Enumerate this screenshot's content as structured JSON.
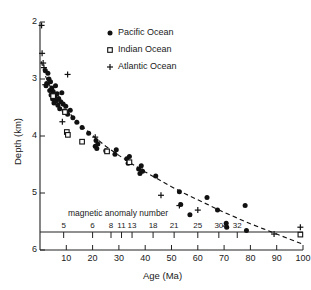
{
  "chart_data": {
    "type": "scatter",
    "title": "",
    "xlabel": "Age (Ma)",
    "ylabel": "Depth (km)",
    "xlim": [
      0,
      100
    ],
    "ylim": [
      6,
      2
    ],
    "y_inverted": true,
    "grid": false,
    "legend_position": "top-center",
    "x_ticks": [
      10,
      20,
      30,
      40,
      50,
      60,
      70,
      80,
      90,
      100
    ],
    "y_ticks": [
      2,
      3,
      4,
      5,
      6
    ],
    "secondary_axis": {
      "title": "magnetic anomaly number",
      "ticks": [
        {
          "label": "5",
          "age": 9
        },
        {
          "label": "6",
          "age": 20
        },
        {
          "label": "8",
          "age": 27
        },
        {
          "label": "11",
          "age": 31
        },
        {
          "label": "13",
          "age": 35
        },
        {
          "label": "18",
          "age": 43
        },
        {
          "label": "21",
          "age": 51
        },
        {
          "label": "25",
          "age": 60
        },
        {
          "label": "30",
          "age": 68
        },
        {
          "label": "32",
          "age": 75
        }
      ]
    },
    "legend": [
      {
        "name": "Pacific Ocean",
        "marker": "filled-circle"
      },
      {
        "name": "Indian Ocean",
        "marker": "open-square"
      },
      {
        "name": "Atlantic Ocean",
        "marker": "plus"
      }
    ],
    "curve": {
      "name": "theoretical subsidence",
      "style": "dashed",
      "model": "depth = 2.45 + 0.345 * sqrt(age)",
      "points": [
        [
          0.5,
          2.69
        ],
        [
          1,
          2.79
        ],
        [
          2,
          2.94
        ],
        [
          3,
          3.05
        ],
        [
          4,
          3.14
        ],
        [
          6,
          3.3
        ],
        [
          8,
          3.43
        ],
        [
          10,
          3.54
        ],
        [
          13,
          3.69
        ],
        [
          16,
          3.83
        ],
        [
          20,
          3.99
        ],
        [
          25,
          4.18
        ],
        [
          30,
          4.34
        ],
        [
          35,
          4.49
        ],
        [
          40,
          4.63
        ],
        [
          45,
          4.76
        ],
        [
          50,
          4.89
        ],
        [
          55,
          5.01
        ],
        [
          60,
          5.12
        ],
        [
          65,
          5.23
        ],
        [
          70,
          5.34
        ],
        [
          75,
          5.44
        ],
        [
          80,
          5.54
        ],
        [
          85,
          5.63
        ],
        [
          90,
          5.72
        ],
        [
          95,
          5.81
        ],
        [
          100,
          5.9
        ]
      ]
    },
    "series": [
      {
        "name": "Pacific Ocean",
        "marker": "filled-circle",
        "points": [
          [
            2.0,
            2.85
          ],
          [
            2.3,
            3.12
          ],
          [
            2.6,
            3.08
          ],
          [
            3.0,
            2.9
          ],
          [
            3.4,
            3.0
          ],
          [
            3.7,
            3.2
          ],
          [
            4.0,
            3.05
          ],
          [
            4.2,
            3.28
          ],
          [
            4.5,
            3.16
          ],
          [
            4.8,
            3.35
          ],
          [
            5.0,
            3.22
          ],
          [
            5.3,
            3.42
          ],
          [
            5.6,
            3.3
          ],
          [
            5.9,
            3.12
          ],
          [
            6.2,
            3.38
          ],
          [
            6.5,
            3.26
          ],
          [
            6.8,
            3.46
          ],
          [
            7.1,
            3.34
          ],
          [
            7.5,
            3.52
          ],
          [
            7.9,
            3.4
          ],
          [
            8.3,
            3.24
          ],
          [
            8.8,
            3.44
          ],
          [
            9.2,
            3.56
          ],
          [
            9.8,
            3.48
          ],
          [
            10.5,
            3.62
          ],
          [
            11.5,
            3.55
          ],
          [
            12.5,
            3.68
          ],
          [
            14.0,
            3.76
          ],
          [
            16.0,
            3.85
          ],
          [
            18.5,
            3.95
          ],
          [
            21.0,
            4.18
          ],
          [
            21.3,
            4.08
          ],
          [
            21.6,
            4.22
          ],
          [
            22.0,
            4.14
          ],
          [
            25.0,
            4.26
          ],
          [
            28.5,
            4.32
          ],
          [
            29.0,
            4.24
          ],
          [
            33.0,
            4.4
          ],
          [
            33.5,
            4.48
          ],
          [
            34.0,
            4.36
          ],
          [
            37.5,
            4.58
          ],
          [
            38.0,
            4.66
          ],
          [
            38.5,
            4.52
          ],
          [
            39.0,
            4.62
          ],
          [
            44.0,
            4.7
          ],
          [
            53.0,
            4.98
          ],
          [
            53.5,
            5.2
          ],
          [
            57.0,
            5.38
          ],
          [
            63.5,
            5.08
          ],
          [
            67.5,
            5.3
          ],
          [
            70.8,
            5.53
          ],
          [
            71.0,
            5.6
          ],
          [
            78.0,
            5.22
          ],
          [
            78.5,
            5.66
          ]
        ]
      },
      {
        "name": "Indian Ocean",
        "marker": "open-square",
        "points": [
          [
            5.0,
            3.3
          ],
          [
            9.5,
            3.58
          ],
          [
            10.2,
            3.93
          ],
          [
            10.6,
            3.98
          ],
          [
            16.0,
            4.1
          ],
          [
            25.5,
            4.27
          ],
          [
            34.0,
            4.46
          ],
          [
            99.0,
            5.73
          ]
        ]
      },
      {
        "name": "Atlantic Ocean",
        "marker": "plus",
        "points": [
          [
            0.6,
            2.06
          ],
          [
            0.8,
            2.55
          ],
          [
            1.2,
            2.72
          ],
          [
            1.5,
            2.8
          ],
          [
            2.0,
            3.1
          ],
          [
            8.5,
            3.75
          ],
          [
            10.5,
            2.92
          ],
          [
            21.0,
            4.02
          ],
          [
            38.0,
            4.58
          ],
          [
            46.0,
            5.04
          ],
          [
            53.0,
            5.22
          ],
          [
            60.0,
            5.3
          ],
          [
            70.5,
            5.58
          ],
          [
            89.0,
            5.72
          ],
          [
            99.0,
            5.6
          ]
        ]
      }
    ]
  },
  "axes": {
    "y_title": "Depth (km)",
    "x_title": "Age (Ma)",
    "anomaly_title": "magnetic anomaly number"
  }
}
